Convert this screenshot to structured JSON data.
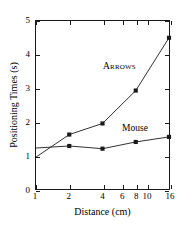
{
  "chart_data": {
    "type": "line",
    "title": "",
    "xlabel": "Distance (cm)",
    "ylabel": "Positioning Times (s)",
    "xscale": "log",
    "xlim": [
      1,
      16
    ],
    "ylim": [
      0,
      5
    ],
    "grid": false,
    "legend_position": "inline-annotation",
    "xticks": [
      1,
      2,
      4,
      6,
      8,
      10,
      16
    ],
    "xticklabels": [
      "1",
      "2",
      "4",
      "6",
      "8",
      "10",
      "16"
    ],
    "yticks": [
      0,
      1,
      2,
      3,
      4,
      5
    ],
    "yticklabels": [
      "0",
      "1",
      "2",
      "3",
      "4",
      "5"
    ],
    "x": [
      1,
      2,
      4,
      8,
      16
    ],
    "series": [
      {
        "name": "Arrows",
        "x": [
          1,
          2,
          4,
          8,
          16
        ],
        "values": [
          0.95,
          1.62,
          1.95,
          2.93,
          4.5
        ],
        "marker": "square",
        "color": "#1a1a1a"
      },
      {
        "name": "Mouse",
        "x": [
          1,
          2,
          4,
          8,
          16
        ],
        "values": [
          1.22,
          1.28,
          1.2,
          1.4,
          1.55
        ],
        "marker": "square",
        "color": "#1a1a1a"
      }
    ],
    "annotations": [
      {
        "text": "Arrows",
        "series": "Arrows"
      },
      {
        "text": "Mouse",
        "series": "Mouse"
      }
    ]
  },
  "axes": {
    "x_title": "Distance (cm)",
    "y_title": "Positioning Times (s)"
  },
  "colors": {
    "line": "#1a1a1a",
    "axis": "#1a1a1a",
    "background": "#ffffff"
  }
}
